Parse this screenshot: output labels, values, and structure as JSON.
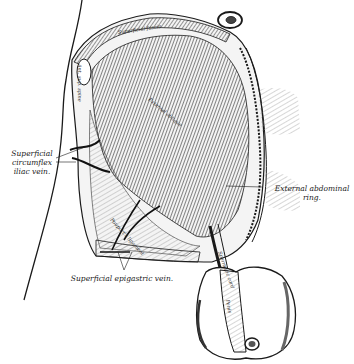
{
  "figure": {
    "labels": {
      "circumflex_vein": "Superficial\ncircumflex\niliac vein.",
      "circumflex_vein_lines": [
        "Superficial",
        "circumflex",
        "iliac vein."
      ],
      "external_ring_lines": [
        "External abdominal",
        "ring."
      ],
      "epigastric_vein": "Superficial epigastric vein."
    },
    "engraved_labels": {
      "top_band": "Superficial fascia",
      "muscle": "External oblique",
      "lateral_strip": "Ant. sup. spine",
      "lower_band": "Poupart's ligament",
      "cord": "Spermatic cord",
      "penis": "Penis"
    },
    "colors": {
      "ink": "#1a1a1a",
      "paper": "#ffffff",
      "shade": "#6b6b6b"
    }
  }
}
